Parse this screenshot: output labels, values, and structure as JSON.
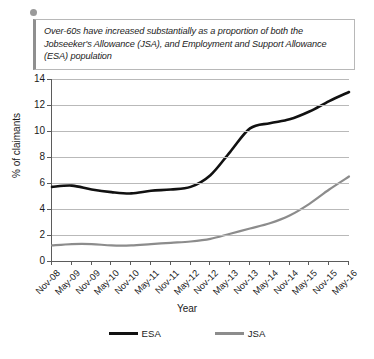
{
  "callout": {
    "text": "Over-60s have increased substantially as a proportion of both the Jobseeker's Allowance (JSA), and Employment and Support Allowance (ESA) population",
    "bullet_icon": "bullet-dot-icon",
    "accent_color": "#8f8f8f"
  },
  "chart_data": {
    "type": "line",
    "title": "",
    "xlabel": "Year",
    "ylabel": "% of claimants",
    "ylim": [
      0,
      14
    ],
    "yticks": [
      0,
      2,
      4,
      6,
      8,
      10,
      12,
      14
    ],
    "grid": true,
    "legend_position": "bottom",
    "categories": [
      "Nov-08",
      "May-09",
      "Nov-09",
      "May-10",
      "Nov-10",
      "May-11",
      "Nov-11",
      "May-12",
      "Nov-12",
      "May-13",
      "Nov-13",
      "May-14",
      "Nov-14",
      "May-15",
      "Nov-15",
      "May-16"
    ],
    "series": [
      {
        "name": "ESA",
        "color": "#111111",
        "values": [
          5.7,
          5.8,
          5.5,
          5.3,
          5.2,
          5.4,
          5.5,
          5.7,
          6.6,
          8.4,
          10.2,
          10.6,
          10.9,
          11.5,
          12.3,
          13.0
        ]
      },
      {
        "name": "JSA",
        "color": "#8c8c8c",
        "values": [
          1.2,
          1.3,
          1.3,
          1.2,
          1.2,
          1.3,
          1.4,
          1.5,
          1.7,
          2.1,
          2.5,
          2.9,
          3.5,
          4.4,
          5.5,
          6.5
        ]
      }
    ]
  }
}
